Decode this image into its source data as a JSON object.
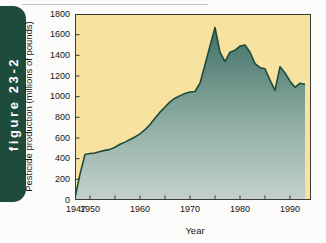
{
  "figure_tab": {
    "label": "figure 23-2"
  },
  "colors": {
    "tab_green": "#1d4b3c",
    "plot_background": "#f7e2a0",
    "area_top": "#3f6f64",
    "area_bottom": "#c3d2cb",
    "line": "#1d4b3c",
    "axis": "#3a3a38",
    "page_background": "#fbfbf9",
    "text": "#141414"
  },
  "chart_data": {
    "type": "area",
    "title": "",
    "xlabel": "Year",
    "ylabel": "Pesticide production (millions of pounds)",
    "xlim": [
      1947,
      1993
    ],
    "ylim": [
      0,
      1800
    ],
    "ytick_labels": [
      "1800",
      "1600",
      "1400",
      "1200",
      "1000",
      "800",
      "600",
      "400",
      "200",
      "0"
    ],
    "ytick_values": [
      1800,
      1600,
      1400,
      1200,
      1000,
      800,
      600,
      400,
      200,
      0
    ],
    "xtick_labels": [
      "1947",
      "1950",
      "1960",
      "1970",
      "1980",
      "1990"
    ],
    "xtick_values": [
      1947,
      1950,
      1960,
      1970,
      1980,
      1990
    ],
    "minor_xtick_values": [
      1950,
      1955,
      1960,
      1965,
      1970,
      1975,
      1980,
      1985,
      1990
    ],
    "grid": false,
    "legend": false,
    "series": [
      {
        "name": "Pesticide production",
        "x": [
          1947,
          1948,
          1949,
          1950,
          1951,
          1952,
          1953,
          1954,
          1955,
          1956,
          1957,
          1958,
          1959,
          1960,
          1961,
          1962,
          1963,
          1964,
          1965,
          1966,
          1967,
          1968,
          1969,
          1970,
          1971,
          1972,
          1973,
          1974,
          1975,
          1976,
          1977,
          1978,
          1979,
          1980,
          1981,
          1982,
          1983,
          1984,
          1985,
          1986,
          1987,
          1988,
          1989,
          1990,
          1991,
          1992,
          1993
        ],
        "values": [
          20,
          250,
          440,
          450,
          455,
          470,
          480,
          490,
          510,
          540,
          560,
          585,
          610,
          640,
          680,
          730,
          790,
          850,
          900,
          950,
          985,
          1010,
          1030,
          1045,
          1050,
          1130,
          1310,
          1490,
          1670,
          1430,
          1340,
          1430,
          1450,
          1490,
          1500,
          1430,
          1320,
          1280,
          1270,
          1160,
          1060,
          1290,
          1230,
          1150,
          1090,
          1130,
          1120
        ]
      }
    ]
  }
}
